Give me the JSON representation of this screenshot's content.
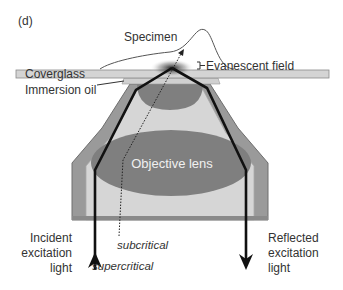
{
  "panel_label": "(d)",
  "labels": {
    "specimen": "Specimen",
    "evanescent_field": "Evanescent field",
    "coverglass": "Coverglass",
    "immersion_oil": "Immersion oil",
    "objective_lens": "Objective lens",
    "incident_line1": "Incident",
    "incident_line2": "excitation",
    "incident_line3": "light",
    "reflected_line1": "Reflected",
    "reflected_line2": "excitation",
    "reflected_line3": "light",
    "subcritical": "subcritical",
    "supercritical": "supercritical"
  },
  "colors": {
    "coverglass": "#d4d4d4",
    "housing_outer": "#9a9a9a",
    "housing_inner": "#d6d6d6",
    "lens": "#7f7f7f",
    "beam": "#111111"
  }
}
